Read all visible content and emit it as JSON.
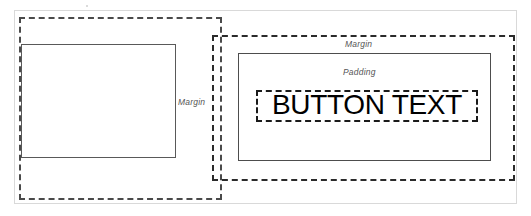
{
  "diagram": {
    "type": "box-model-diagram",
    "colors": {
      "dashed_stroke_dark": "#1a1a1a",
      "dashed_stroke_mid": "#2b2b2b",
      "dashed_stroke_light": "#4a4a4a",
      "solid_stroke": "#595959",
      "label_text": "#555555",
      "button_text": "#000000",
      "frame": "#d9d9d9",
      "background": "#ffffff"
    },
    "left_group": {
      "name": "left-button-box",
      "margin_label": "Margin",
      "margin_box": {
        "border_style": "dashed",
        "x": 19,
        "y": 17,
        "w": 203,
        "h": 183
      },
      "content_box": {
        "border_style": "solid",
        "x": 21,
        "y": 44,
        "w": 155,
        "h": 114
      }
    },
    "right_group": {
      "name": "right-button-box",
      "margin_label": "Margin",
      "padding_label": "Padding",
      "button_label": "BUTTON TEXT",
      "margin_box": {
        "border_style": "dashed",
        "x": 212,
        "y": 35,
        "w": 303,
        "h": 146
      },
      "padding_box": {
        "border_style": "solid",
        "x": 238,
        "y": 53,
        "w": 253,
        "h": 108
      },
      "text_box": {
        "border_style": "dashed",
        "x": 256,
        "y": 90,
        "w": 222,
        "h": 32
      }
    }
  }
}
